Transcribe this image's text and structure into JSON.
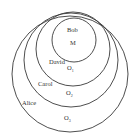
{
  "diagram": {
    "type": "nested-circles",
    "circles": [
      {
        "name": "Alice",
        "symbol": "O",
        "subscript": "3",
        "cx": 70,
        "cy": 74,
        "r": 58,
        "name_pos": [
          22,
          105
        ],
        "symbol_pos": [
          64,
          120
        ]
      },
      {
        "name": "Carol",
        "symbol": "O",
        "subscript": "2",
        "cx": 71,
        "cy": 60,
        "r": 47,
        "name_pos": [
          38,
          86
        ],
        "symbol_pos": [
          66,
          95
        ]
      },
      {
        "name": "David",
        "symbol": "O",
        "subscript": "1",
        "cx": 73,
        "cy": 49,
        "r": 37,
        "name_pos": [
          49,
          64
        ],
        "symbol_pos": [
          67,
          70
        ]
      },
      {
        "name": "Bob",
        "symbol": "M",
        "subscript": "",
        "cx": 74,
        "cy": 40,
        "r": 22,
        "name_pos": [
          67,
          32
        ],
        "symbol_pos": [
          70,
          45
        ]
      }
    ],
    "stroke_color": "#3a3a3a",
    "text_color": "#333333"
  }
}
